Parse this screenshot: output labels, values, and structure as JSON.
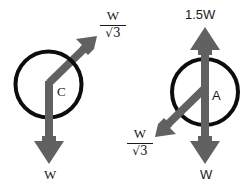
{
  "figure": {
    "background_color": "#ffffff",
    "arrow_color": "#616161",
    "circle_stroke_color": "#0d0d0d",
    "text_color": "#1a1a1a",
    "diagrams": [
      {
        "id": "left",
        "center_label": "C",
        "circle": {
          "cx": 48.5,
          "cy": 84.5,
          "r": 33,
          "stroke_width": 4
        },
        "forces": [
          {
            "name": "weight-down",
            "label_numerator": "W",
            "label_denominator": "",
            "label_text": "W",
            "direction": "down",
            "from": {
              "x": 49,
              "y": 83
            },
            "to": {
              "x": 49,
              "y": 163
            },
            "label_pos": {
              "x": 51,
              "y": 174
            }
          },
          {
            "name": "tension-diagonal",
            "label_numerator": "W",
            "label_denominator": "√3",
            "label_text": "W/√3",
            "direction": "up-right",
            "from": {
              "x": 49,
              "y": 83
            },
            "to": {
              "x": 97,
              "y": 36
            },
            "label_pos": {
              "x": 112,
              "y": 24
            }
          }
        ]
      },
      {
        "id": "right",
        "center_label": "A",
        "circle": {
          "cx": 205,
          "cy": 92,
          "r": 33,
          "stroke_width": 4
        },
        "forces": [
          {
            "name": "applied-up",
            "label_numerator": "1.5W",
            "label_denominator": "",
            "label_text": "1.5W",
            "direction": "up",
            "from": {
              "x": 205,
              "y": 163
            },
            "to": {
              "x": 205,
              "y": 27
            },
            "label_pos": {
              "x": 207,
              "y": 15
            }
          },
          {
            "name": "weight-down",
            "label_numerator": "W",
            "label_denominator": "",
            "label_text": "W",
            "direction": "down",
            "from": {
              "x": 205,
              "y": 27
            },
            "to": {
              "x": 205,
              "y": 163
            },
            "label_pos": {
              "x": 207,
              "y": 174
            }
          },
          {
            "name": "tension-diagonal",
            "label_numerator": "W",
            "label_denominator": "√3",
            "label_text": "W/√3",
            "direction": "down-left",
            "from": {
              "x": 205,
              "y": 88
            },
            "to": {
              "x": 155,
              "y": 137
            },
            "label_pos": {
              "x": 140,
              "y": 146
            }
          }
        ]
      }
    ]
  },
  "labels": {
    "left_fraction_numerator": "W",
    "left_fraction_denominator": "√3",
    "left_center": "C",
    "left_bottom": "W",
    "right_top": "1.5W",
    "right_center": "A",
    "right_fraction_numerator": "W",
    "right_fraction_denominator": "√3",
    "right_bottom": "W"
  }
}
